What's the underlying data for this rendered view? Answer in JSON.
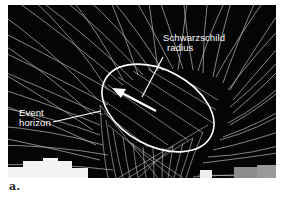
{
  "figure": {
    "labels": {
      "schwarzschild_line1": "Schwarzschild",
      "schwarzschild_line2": "radius",
      "event_line1": "Event",
      "event_line2": "horizon"
    },
    "caption": "a.",
    "colors": {
      "background": "#050505",
      "grid": "#cfcfcf",
      "ellipse": "#ffffff",
      "page": "#ffffff"
    }
  }
}
